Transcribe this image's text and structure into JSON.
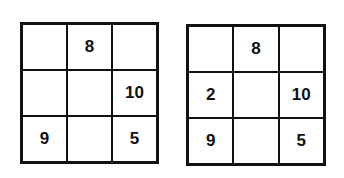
{
  "grids": [
    {
      "cells": [
        "",
        "8",
        "",
        "",
        "",
        "10",
        "9",
        "",
        "5"
      ]
    },
    {
      "cells": [
        "",
        "8",
        "",
        "2",
        "",
        "10",
        "9",
        "",
        "5"
      ]
    }
  ]
}
